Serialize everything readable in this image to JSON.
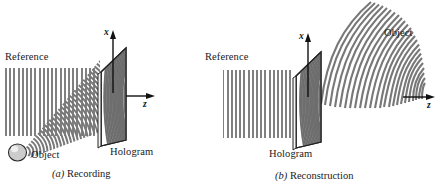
{
  "figure": {
    "background": "#ffffff",
    "wave_color": "#808080",
    "wave_color_dark": "#6e6e6e",
    "outline_color": "#1a1a1a",
    "sphere_color": "#c9c9c9"
  },
  "panel_a": {
    "caption_tag": "(a)",
    "caption_text": " Recording",
    "reference_label": "Reference",
    "object_label": "Object",
    "hologram_label": "Hologram",
    "axis_x": "x",
    "axis_z": "z",
    "icons": {
      "sphere": "sphere-object-icon",
      "plate": "hologram-plate-icon",
      "reference_wave": "reference-plane-wave-icon",
      "object_wave": "object-spherical-wave-icon",
      "x_arrow": "x-axis-arrow-icon",
      "z_arrow": "z-axis-arrow-icon"
    }
  },
  "panel_b": {
    "caption_tag": "(b)",
    "caption_text": " Reconstruction",
    "reference_label": "Reference",
    "object_label": "Object",
    "hologram_label": "Hologram",
    "axis_x": "x",
    "axis_z": "z",
    "icons": {
      "plate": "hologram-plate-icon",
      "reference_wave": "reference-plane-wave-icon",
      "object_wave": "reconstructed-object-wave-icon",
      "x_arrow": "x-axis-arrow-icon",
      "z_arrow": "z-axis-arrow-icon"
    }
  }
}
